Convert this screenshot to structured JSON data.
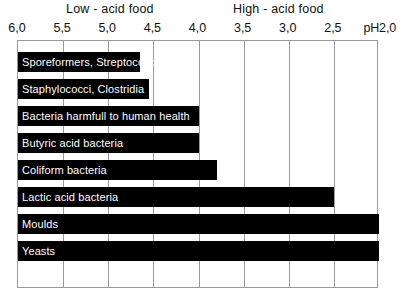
{
  "regions": {
    "low": "Low - acid food",
    "high": "High - acid food"
  },
  "axis": {
    "unit_prefix": "pH",
    "ticks": [
      "6,0",
      "5,5",
      "5,0",
      "4,5",
      "4,0",
      "3,5",
      "3,0",
      "2,5",
      "2,0"
    ]
  },
  "bars": [
    {
      "label": "Sporeformers, Streptococci"
    },
    {
      "label": "Staphylococci, Clostridia"
    },
    {
      "label": "Bacteria harmfull to human health"
    },
    {
      "label": "Butyric acid bacteria"
    },
    {
      "label": "Coliform bacteria"
    },
    {
      "label": "Lactic acid bacteria"
    },
    {
      "label": "Moulds"
    },
    {
      "label": "Yeasts"
    }
  ],
  "colors": {
    "bar": "#000000",
    "bar_text": "#ffffff",
    "grid": "#9a9a9a",
    "background": "#ffffff",
    "text": "#111111"
  },
  "chart_data": {
    "type": "bar",
    "orientation": "horizontal",
    "title": "",
    "subtitle": "",
    "xlabel": "pH",
    "ylabel": "",
    "xlim": [
      6.0,
      2.0
    ],
    "x_axis_reversed": true,
    "x_ticks": [
      6.0,
      5.5,
      5.0,
      4.5,
      4.0,
      3.5,
      3.0,
      2.5,
      2.0
    ],
    "x_tick_labels": [
      "6,0",
      "5,5",
      "5,0",
      "4,5",
      "4,0",
      "3,5",
      "3,0",
      "2,5",
      "2,0"
    ],
    "grid": true,
    "grid_axis": "x",
    "legend": false,
    "bar_start_ph": 6.0,
    "categories": [
      "Sporeformers, Streptococci",
      "Staphylococci, Clostridia",
      "Bacteria harmfull to human health",
      "Butyric acid bacteria",
      "Coliform bacteria",
      "Lactic acid bacteria",
      "Moulds",
      "Yeasts"
    ],
    "values": [
      4.65,
      4.55,
      4.0,
      4.0,
      3.8,
      2.5,
      2.0,
      2.0
    ],
    "value_description": "Minimum pH at which each organism group grows; each bar spans from pH 6,0 down to the listed value",
    "annotations": [
      {
        "text": "Low - acid food",
        "x_range": [
          6.0,
          4.5
        ],
        "position": "top"
      },
      {
        "text": "High - acid food",
        "x_range": [
          4.0,
          2.0
        ],
        "position": "top"
      }
    ]
  }
}
